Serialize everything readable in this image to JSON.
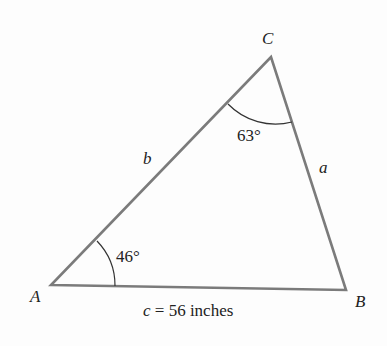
{
  "diagram": {
    "type": "triangle",
    "vertices": {
      "A": {
        "label": "A",
        "x": 51,
        "y": 285
      },
      "B": {
        "label": "B",
        "x": 346,
        "y": 290
      },
      "C": {
        "label": "C",
        "x": 271,
        "y": 57
      }
    },
    "sides": {
      "a": {
        "label": "a"
      },
      "b": {
        "label": "b"
      },
      "c": {
        "var": "c",
        "eq": " = 56 inches"
      }
    },
    "angles": {
      "A": {
        "value": "46°"
      },
      "C": {
        "value": "63°"
      }
    },
    "colors": {
      "edge": "#7b7b7b",
      "arc": "#333333",
      "text": "#222222"
    }
  }
}
